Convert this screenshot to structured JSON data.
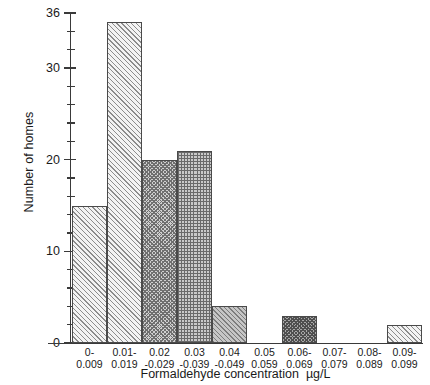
{
  "chart_data": {
    "type": "bar",
    "title": "",
    "xlabel": "Formaldehyde concentration  µg/L",
    "ylabel": "Number of homes",
    "categories": [
      "0-0.009",
      "0.01-0.019",
      "0.02-0.029",
      "0.03-0.039",
      "0.04-0.049",
      "0.05-0.059",
      "0.06-0.069",
      "0.07-0.079",
      "0.08-0.089",
      "0.09-0.099"
    ],
    "category_labels": [
      {
        "line1": "0-",
        "line2": "0.009"
      },
      {
        "line1": "0.01-",
        "line2": "0.019"
      },
      {
        "line1": "0.02",
        "line2": "-0.029"
      },
      {
        "line1": "0.03",
        "line2": "-0.039"
      },
      {
        "line1": "0.04",
        "line2": "-0.049"
      },
      {
        "line1": "0.05",
        "line2": "0.059"
      },
      {
        "line1": "0.06-",
        "line2": "0.069"
      },
      {
        "line1": "0.07-",
        "line2": "0.079"
      },
      {
        "line1": "0.08-",
        "line2": "0.089"
      },
      {
        "line1": "0.09-",
        "line2": "0.099"
      }
    ],
    "values": [
      15,
      35,
      20,
      21,
      4,
      0,
      3,
      0,
      0,
      2
    ],
    "bar_patterns": [
      "diagonal-hatch-light",
      "diagonal-hatch-light",
      "checkerboard",
      "fine-grid",
      "diagonal-hatch-gray",
      "none",
      "checkerboard-dark",
      "none",
      "none",
      "diagonal-hatch-light"
    ],
    "ylim": [
      0,
      36
    ],
    "xlim_categories": 10,
    "y_major_ticks": [
      0,
      10,
      20,
      30,
      36
    ],
    "y_minor_tick_step": 2,
    "grid": false,
    "legend": "none",
    "axis_color": "#3a3a3a",
    "bar_outline_color": "#4a4a4a"
  }
}
